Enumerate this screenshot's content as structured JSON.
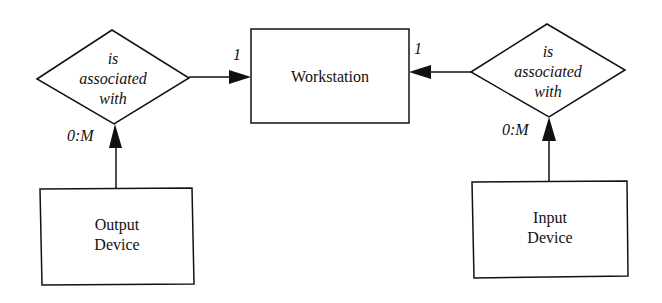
{
  "diagram": {
    "type": "entity-relationship",
    "entities": [
      {
        "id": "workstation",
        "label": "Workstation"
      },
      {
        "id": "output_device",
        "label_lines": [
          "Output",
          "Device"
        ]
      },
      {
        "id": "input_device",
        "label_lines": [
          "Input",
          "Device"
        ]
      }
    ],
    "relationships": [
      {
        "id": "rel_left",
        "label_lines": [
          "is",
          "associated",
          "with"
        ],
        "from": "output_device",
        "to": "workstation",
        "cardinality_source": "0:M",
        "cardinality_target": "1"
      },
      {
        "id": "rel_right",
        "label_lines": [
          "is",
          "associated",
          "with"
        ],
        "from": "input_device",
        "to": "workstation",
        "cardinality_source": "0:M",
        "cardinality_target": "1"
      }
    ]
  }
}
